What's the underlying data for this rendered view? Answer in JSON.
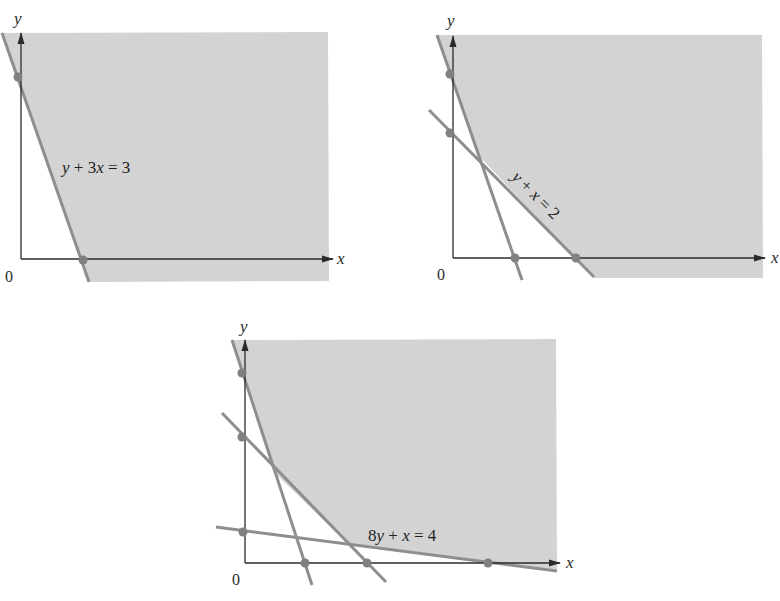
{
  "colors": {
    "background": "#ffffff",
    "shading": "#d3d3d3",
    "constraint_line": "#8e8e8e",
    "point": "#808080",
    "axis": "#2a2a2a",
    "text": "#1e1e1e"
  },
  "diagrams": [
    {
      "id": "feasible-region-1",
      "axis_labels": {
        "x": "x",
        "y": "y",
        "origin": "0"
      },
      "constraints": [
        {
          "equation": "y + 3x = 3",
          "label_parts": [
            "y",
            " + 3",
            "x",
            " = 3"
          ],
          "y_intercept": 3,
          "x_intercept": 1
        }
      ],
      "marked_points": [
        {
          "x": 0,
          "y": 3
        },
        {
          "x": 1,
          "y": 0
        }
      ]
    },
    {
      "id": "feasible-region-2",
      "axis_labels": {
        "x": "x",
        "y": "y",
        "origin": "0"
      },
      "constraints": [
        {
          "equation": "y + 3x = 3",
          "y_intercept": 3,
          "x_intercept": 1
        },
        {
          "equation": "y + x = 2",
          "label_parts": [
            "y",
            " + ",
            "x",
            " = 2"
          ],
          "y_intercept": 2,
          "x_intercept": 2
        }
      ],
      "marked_points": [
        {
          "x": 0,
          "y": 3
        },
        {
          "x": 0,
          "y": 2
        },
        {
          "x": 1,
          "y": 0
        },
        {
          "x": 2,
          "y": 0
        }
      ]
    },
    {
      "id": "feasible-region-3",
      "axis_labels": {
        "x": "x",
        "y": "y",
        "origin": "0"
      },
      "constraints": [
        {
          "equation": "y + 3x = 3",
          "y_intercept": 3,
          "x_intercept": 1
        },
        {
          "equation": "y + x = 2",
          "y_intercept": 2,
          "x_intercept": 2
        },
        {
          "equation": "8y + x = 4",
          "label_parts": [
            "8",
            "y",
            " + ",
            "x",
            " = 4"
          ],
          "y_intercept": 0.5,
          "x_intercept": 4
        }
      ],
      "marked_points": [
        {
          "x": 0,
          "y": 3
        },
        {
          "x": 0,
          "y": 2
        },
        {
          "x": 0,
          "y": 0.5
        },
        {
          "x": 1,
          "y": 0
        },
        {
          "x": 2,
          "y": 0
        },
        {
          "x": 4,
          "y": 0
        }
      ]
    }
  ]
}
